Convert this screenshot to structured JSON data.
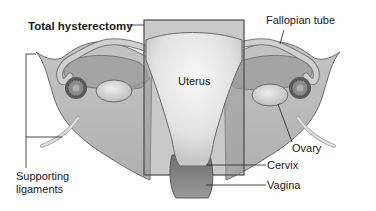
{
  "diagram": {
    "title": "Total hysterectomy",
    "labels": {
      "total_hysterectomy": "Total hysterectomy",
      "fallopian_tube": "Fallopian tube",
      "uterus": "Uterus",
      "ovary": "Ovary",
      "cervix": "Cervix",
      "vagina": "Vagina",
      "supporting_ligaments_line1": "Supporting",
      "supporting_ligaments_line2": "ligaments"
    },
    "colors": {
      "background": "#ffffff",
      "tissue_light": "#d4d4d4",
      "tissue_mid": "#a8a8a8",
      "tissue_dark": "#7a7a7a",
      "uterus_fill": "#e6e6e6",
      "removal_box_fill": "#9a9a9a",
      "outline": "#555555",
      "leader_line": "#222222"
    }
  }
}
